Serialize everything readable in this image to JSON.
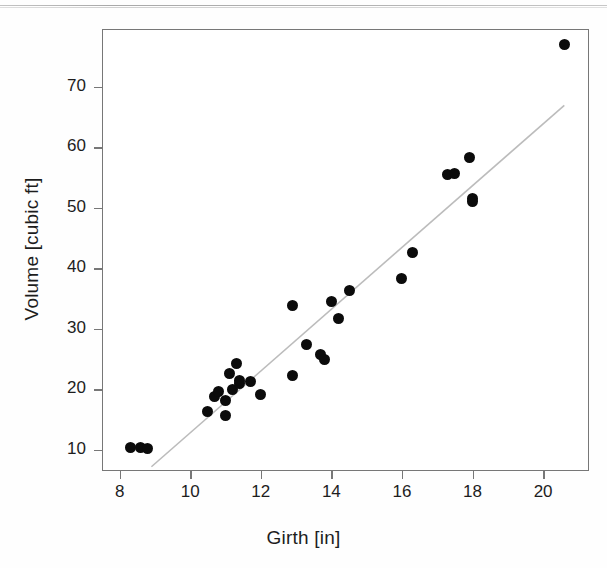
{
  "figure": {
    "background_color": "#ffffff",
    "frame_color": "#777777",
    "marker_color": "#0b0b0b",
    "fit_line_color": "#bcbcbc"
  },
  "chart_data": {
    "type": "scatter",
    "title": "",
    "xlabel": "Girth [in]",
    "ylabel": "Volume [cubic ft]",
    "xlim": [
      7.5,
      21.3
    ],
    "ylim": [
      6.5,
      79.5
    ],
    "xticks": [
      8,
      10,
      12,
      14,
      16,
      18,
      20
    ],
    "yticks": [
      10,
      20,
      30,
      40,
      50,
      60,
      70
    ],
    "xticklabels": [
      "8",
      "10",
      "12",
      "14",
      "16",
      "18",
      "20"
    ],
    "yticklabels": [
      "10",
      "20",
      "30",
      "40",
      "50",
      "60",
      "70"
    ],
    "grid": false,
    "legend": null,
    "marker": "filled-circle",
    "x": [
      8.3,
      8.6,
      8.8,
      10.5,
      10.7,
      10.8,
      11.0,
      11.0,
      11.1,
      11.2,
      11.3,
      11.4,
      11.4,
      11.7,
      12.0,
      12.9,
      12.9,
      13.3,
      13.7,
      13.8,
      14.0,
      14.2,
      14.5,
      16.0,
      16.3,
      17.3,
      17.5,
      17.9,
      18.0,
      18.0,
      20.6
    ],
    "y": [
      10.3,
      10.3,
      10.2,
      16.4,
      18.8,
      19.7,
      15.6,
      18.2,
      22.6,
      19.9,
      24.2,
      21.0,
      21.4,
      21.3,
      19.1,
      22.2,
      33.8,
      27.4,
      25.7,
      24.9,
      34.5,
      31.7,
      36.3,
      38.3,
      42.6,
      55.4,
      55.7,
      58.3,
      51.5,
      51.0,
      77.0
    ],
    "series": [
      {
        "name": "trees",
        "points": [
          [
            8.3,
            10.3
          ],
          [
            8.6,
            10.3
          ],
          [
            8.8,
            10.2
          ],
          [
            10.5,
            16.4
          ],
          [
            10.7,
            18.8
          ],
          [
            10.8,
            19.7
          ],
          [
            11.0,
            15.6
          ],
          [
            11.0,
            18.2
          ],
          [
            11.1,
            22.6
          ],
          [
            11.2,
            19.9
          ],
          [
            11.3,
            24.2
          ],
          [
            11.4,
            21.0
          ],
          [
            11.4,
            21.4
          ],
          [
            11.7,
            21.3
          ],
          [
            12.0,
            19.1
          ],
          [
            12.9,
            22.2
          ],
          [
            12.9,
            33.8
          ],
          [
            13.3,
            27.4
          ],
          [
            13.7,
            25.7
          ],
          [
            13.8,
            24.9
          ],
          [
            14.0,
            34.5
          ],
          [
            14.2,
            31.7
          ],
          [
            14.5,
            36.3
          ],
          [
            16.0,
            38.3
          ],
          [
            16.3,
            42.6
          ],
          [
            17.3,
            55.4
          ],
          [
            17.5,
            55.7
          ],
          [
            17.9,
            58.3
          ],
          [
            18.0,
            51.5
          ],
          [
            18.0,
            51.0
          ],
          [
            20.6,
            77.0
          ]
        ]
      }
    ],
    "fit_line": {
      "type": "linear-regression",
      "x_start": 8.9,
      "y_start": 7.2,
      "x_end": 20.6,
      "y_end": 66.9
    },
    "annotations": []
  }
}
